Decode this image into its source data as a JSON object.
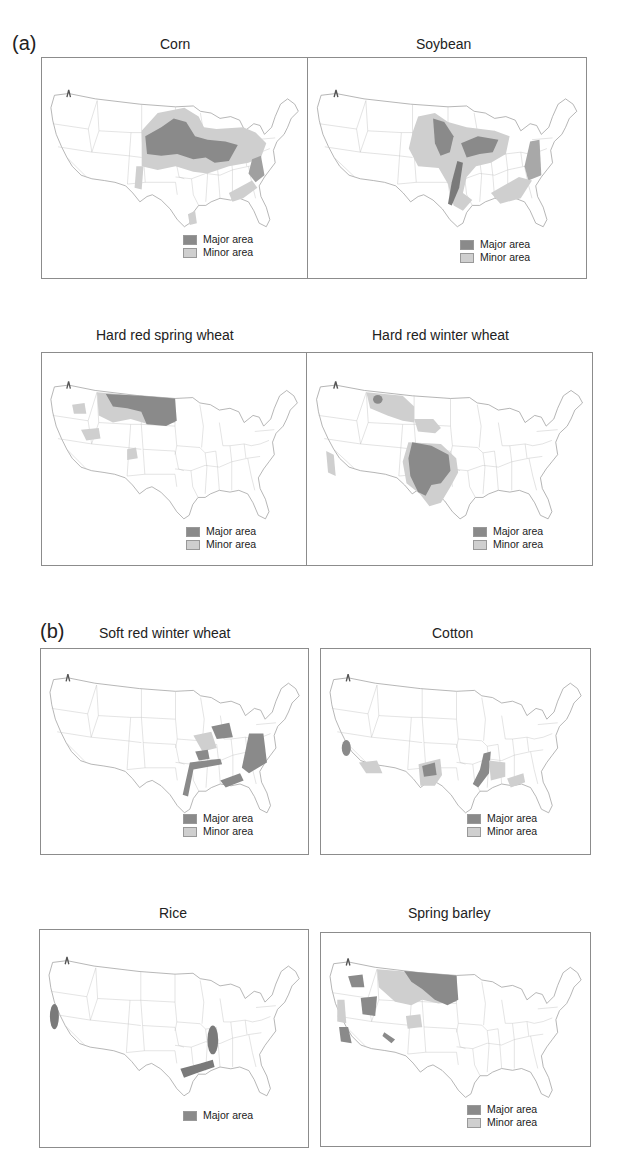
{
  "figure": {
    "sections": [
      {
        "label": "(a)"
      },
      {
        "label": "(b)"
      }
    ],
    "colors": {
      "major_area": "#8a8a8a",
      "minor_area": "#cfcfcf",
      "border": "#8c8c8c",
      "state_lines": "#b5b5b5"
    },
    "legend": {
      "major_label": "Major area",
      "minor_label": "Minor area"
    },
    "panels": [
      {
        "title": "Corn",
        "section": "(a)",
        "legend": [
          "Major area",
          "Minor area"
        ]
      },
      {
        "title": "Soybean",
        "section": "(a)",
        "legend": [
          "Major area",
          "Minor area"
        ]
      },
      {
        "title": "Hard red spring wheat",
        "section": "(a)",
        "legend": [
          "Major area",
          "Minor area"
        ]
      },
      {
        "title": "Hard red winter wheat",
        "section": "(a)",
        "legend": [
          "Major area",
          "Minor area"
        ]
      },
      {
        "title": "Soft red winter wheat",
        "section": "(b)",
        "legend": [
          "Major area",
          "Minor area"
        ]
      },
      {
        "title": "Cotton",
        "section": "(b)",
        "legend": [
          "Major area",
          "Minor area"
        ]
      },
      {
        "title": "Rice",
        "section": "(b)",
        "legend": [
          "Major area"
        ]
      },
      {
        "title": "Spring barley",
        "section": "(b)",
        "legend": [
          "Major area",
          "Minor area"
        ]
      }
    ]
  }
}
